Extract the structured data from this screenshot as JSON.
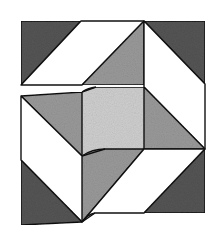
{
  "diagram": {
    "title": "Quilt block",
    "colors": {
      "background": "#ffffff",
      "dark": "#555555",
      "mid": "#9a9a9a",
      "light": "#cfcfcf",
      "white": "#ffffff",
      "stroke": "#111111"
    },
    "pieces": [
      {
        "name": "top-left-dark-triangle",
        "fill": "dark",
        "points": "21,21 81,21 21,85"
      },
      {
        "name": "top-white-parallelogram",
        "fill": "white",
        "points": "81,21 144,21 82,85 21,85"
      },
      {
        "name": "top-gray-triangle",
        "fill": "mid",
        "points": "82,85 144,21 144,85"
      },
      {
        "name": "top-right-dark-triangle",
        "fill": "dark",
        "points": "144,21 205,21 205,84"
      },
      {
        "name": "right-white-parallelogram",
        "fill": "white",
        "points": "144,21 205,84 205,149 144,87"
      },
      {
        "name": "right-gray-triangle",
        "fill": "mid",
        "points": "144,87 205,149 144,149"
      },
      {
        "name": "center-square",
        "fill": "light",
        "points": "82,92 96,87 144,87 144,149 105,149 82,156"
      },
      {
        "name": "left-gray-triangle",
        "fill": "mid",
        "points": "21,96 82,92 82,156"
      },
      {
        "name": "left-white-parallelogram",
        "fill": "white",
        "points": "21,96 82,156 82,222 21,160"
      },
      {
        "name": "bottom-left-dark-triangle",
        "fill": "dark",
        "points": "21,160 82,222 21,225"
      },
      {
        "name": "bottom-gray-triangle",
        "fill": "mid",
        "points": "82,156 105,149 144,149 82,222"
      },
      {
        "name": "bottom-white-parallelogram",
        "fill": "white",
        "points": "144,149 205,149 144,213 95,213 82,222"
      },
      {
        "name": "bottom-right-dark-triangle",
        "fill": "dark",
        "points": "205,149 205,213 144,213"
      }
    ]
  }
}
